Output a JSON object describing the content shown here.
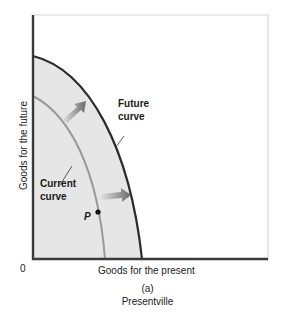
{
  "diagram": {
    "type": "production-possibilities-frontier",
    "y_axis_label": "Goods for the future",
    "x_axis_label": "Goods for the present",
    "origin_label": "0",
    "curves": [
      {
        "name": "Current",
        "label_line1": "Current",
        "label_line2": "curve",
        "color": "#9a9a9a"
      },
      {
        "name": "Future",
        "label_line1": "Future",
        "label_line2": "curve",
        "color": "#2b2b2b"
      }
    ],
    "point_label": "P",
    "panel_label": "(a)",
    "caption": "Presentville",
    "colors": {
      "fill": "#e6e6e6",
      "axis": "#3a3a3a",
      "arrow": "#7a7a7a",
      "frame": "#d8d8d8"
    }
  }
}
